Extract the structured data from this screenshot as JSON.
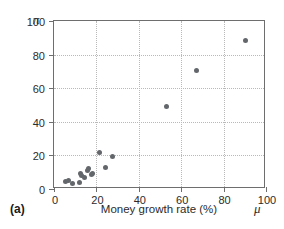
{
  "figure": {
    "panel_label": "(a)",
    "y_axis_symbol": "π",
    "x_axis_symbol": "μ"
  },
  "chart_data": {
    "type": "scatter",
    "title": "",
    "xlabel": "Money growth rate (%)",
    "ylabel": "Inflation rate (%)",
    "xlim": [
      0,
      100
    ],
    "ylim": [
      0,
      100
    ],
    "xticks": [
      0,
      20,
      40,
      60,
      80,
      100
    ],
    "yticks": [
      0,
      20,
      40,
      60,
      80,
      100
    ],
    "xtick_labels": [
      "0",
      "20",
      "40",
      "60",
      "80",
      "100"
    ],
    "ytick_labels": [
      "0",
      "20",
      "40",
      "60",
      "80",
      "100"
    ],
    "grid": true,
    "grid_style": "dotted",
    "legend": null,
    "marker_color": "#63676b",
    "marker_shape": "circle",
    "points": [
      {
        "x": 5.5,
        "y": 4.5
      },
      {
        "x": 7.0,
        "y": 5.0
      },
      {
        "x": 8.5,
        "y": 3.5
      },
      {
        "x": 12.0,
        "y": 4.0
      },
      {
        "x": 12.5,
        "y": 9.0
      },
      {
        "x": 13.0,
        "y": 8.0
      },
      {
        "x": 14.5,
        "y": 7.0
      },
      {
        "x": 16.0,
        "y": 11.0
      },
      {
        "x": 16.5,
        "y": 12.5
      },
      {
        "x": 17.5,
        "y": 8.5
      },
      {
        "x": 18.0,
        "y": 9.0
      },
      {
        "x": 21.5,
        "y": 22.0
      },
      {
        "x": 24.5,
        "y": 13.0
      },
      {
        "x": 27.5,
        "y": 19.5
      },
      {
        "x": 53.0,
        "y": 49.0
      },
      {
        "x": 67.0,
        "y": 70.5
      },
      {
        "x": 90.5,
        "y": 88.5
      }
    ]
  }
}
